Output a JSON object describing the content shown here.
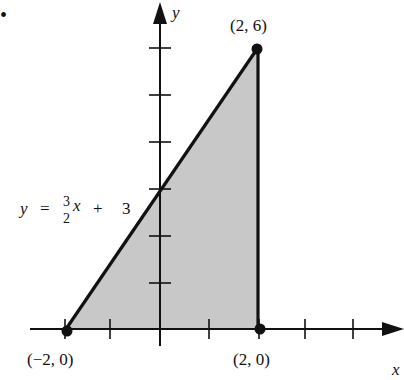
{
  "figure": {
    "bullet": "•",
    "axes": {
      "x_label": "x",
      "y_label": "y",
      "origin_px": [
        160,
        329
      ],
      "unit_px_x": 48.5,
      "unit_px_y": 46.8,
      "x_ticks": [
        -2,
        -1,
        1,
        2,
        3,
        4
      ],
      "y_ticks": [
        1,
        2,
        3,
        4,
        5,
        6
      ]
    },
    "region": {
      "description": "Shaded triangle bounded by y = 3/2 x + 3, x = 2, and the x-axis",
      "fill_color": "#c8c8c8",
      "vertices": [
        [
          -2,
          0
        ],
        [
          2,
          6
        ],
        [
          2,
          0
        ]
      ]
    },
    "line": {
      "equation_lhs": "y",
      "equals": "=",
      "numerator": "3",
      "denominator": "2",
      "var": "x",
      "plus": "+",
      "constant": "3"
    },
    "points": [
      {
        "label": "(2, 6)",
        "x": 2,
        "y": 6
      },
      {
        "label": "(−2, 0)",
        "x": -2,
        "y": 0
      },
      {
        "label": "(2, 0)",
        "x": 2,
        "y": 0
      }
    ]
  }
}
